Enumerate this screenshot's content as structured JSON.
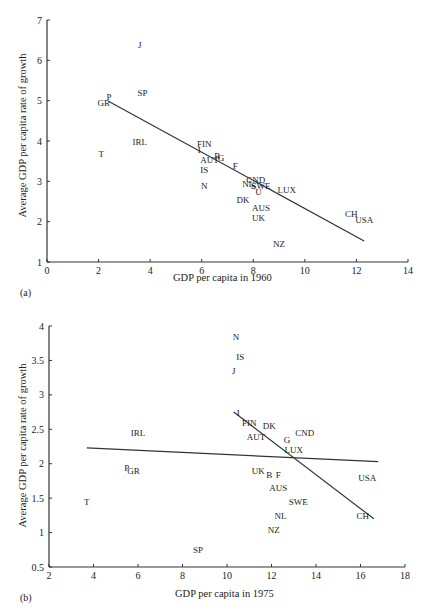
{
  "chart_data": [
    {
      "id": "a",
      "type": "scatter",
      "panel_label": "(a)",
      "title": "",
      "xlabel": "GDP per capita in 1960",
      "ylabel": "Average GDP per capita rate of growth",
      "xlim": [
        0,
        14
      ],
      "ylim": [
        1,
        7
      ],
      "xticks": [
        0,
        2,
        4,
        6,
        8,
        10,
        12,
        14
      ],
      "yticks": [
        1,
        2,
        3,
        4,
        5,
        6,
        7
      ],
      "grid": false,
      "legend": null,
      "points": [
        {
          "label": "J",
          "x": 3.6,
          "y": 6.4
        },
        {
          "label": "SP",
          "x": 3.7,
          "y": 5.2
        },
        {
          "label": "P",
          "x": 2.4,
          "y": 5.1
        },
        {
          "label": "GR",
          "x": 2.2,
          "y": 4.95
        },
        {
          "label": "IRL",
          "x": 3.6,
          "y": 4.0
        },
        {
          "label": "T",
          "x": 2.1,
          "y": 3.7
        },
        {
          "label": "FIN",
          "x": 6.1,
          "y": 3.95
        },
        {
          "label": "I",
          "x": 5.9,
          "y": 3.8
        },
        {
          "label": "AUT",
          "x": 6.3,
          "y": 3.55
        },
        {
          "label": "B",
          "x": 6.6,
          "y": 3.65
        },
        {
          "label": "G",
          "x": 6.75,
          "y": 3.6
        },
        {
          "label": "IS",
          "x": 6.1,
          "y": 3.3
        },
        {
          "label": "F",
          "x": 7.3,
          "y": 3.4
        },
        {
          "label": "N",
          "x": 6.1,
          "y": 2.9
        },
        {
          "label": "NL",
          "x": 7.8,
          "y": 2.95
        },
        {
          "label": "CND",
          "x": 8.1,
          "y": 3.05
        },
        {
          "label": "S",
          "x": 8.0,
          "y": 2.9
        },
        {
          "label": "SWE",
          "x": 8.3,
          "y": 2.9
        },
        {
          "label": "U",
          "x": 8.2,
          "y": 2.75
        },
        {
          "label": "LUX",
          "x": 9.3,
          "y": 2.8
        },
        {
          "label": "DK",
          "x": 7.6,
          "y": 2.55
        },
        {
          "label": "AUS",
          "x": 8.3,
          "y": 2.35
        },
        {
          "label": "UK",
          "x": 8.2,
          "y": 2.1
        },
        {
          "label": "CH",
          "x": 11.8,
          "y": 2.2
        },
        {
          "label": "USA",
          "x": 12.3,
          "y": 2.05
        },
        {
          "label": "NZ",
          "x": 9.0,
          "y": 1.45
        }
      ],
      "regression_lines": [
        {
          "x1": 2.4,
          "y1": 4.98,
          "x2": 12.3,
          "y2": 1.52
        }
      ]
    },
    {
      "id": "b",
      "type": "scatter",
      "panel_label": "(b)",
      "title": "",
      "xlabel": "GDP per capita in 1975",
      "ylabel": "Average GDP per capita rate of growth",
      "xlim": [
        2,
        18
      ],
      "ylim": [
        0.5,
        4
      ],
      "xticks": [
        2,
        4,
        6,
        8,
        10,
        12,
        14,
        16,
        18
      ],
      "yticks": [
        0.5,
        1,
        1.5,
        2,
        2.5,
        3,
        3.5,
        4
      ],
      "ytick_labels": [
        "0.5",
        "1",
        "1.5",
        "2",
        "2.5",
        "3",
        "3.5",
        "4"
      ],
      "grid": false,
      "legend": null,
      "points": [
        {
          "label": "N",
          "x": 10.4,
          "y": 3.85
        },
        {
          "label": "IS",
          "x": 10.6,
          "y": 3.55
        },
        {
          "label": "J",
          "x": 10.3,
          "y": 3.35
        },
        {
          "label": "IRL",
          "x": 6.0,
          "y": 2.45
        },
        {
          "label": "I",
          "x": 10.5,
          "y": 2.75
        },
        {
          "label": "FIN",
          "x": 11.0,
          "y": 2.6
        },
        {
          "label": "DK",
          "x": 11.9,
          "y": 2.55
        },
        {
          "label": "AUT",
          "x": 11.3,
          "y": 2.4
        },
        {
          "label": "G",
          "x": 12.7,
          "y": 2.35
        },
        {
          "label": "CND",
          "x": 13.5,
          "y": 2.45
        },
        {
          "label": "LUX",
          "x": 13.0,
          "y": 2.2
        },
        {
          "label": "P",
          "x": 5.5,
          "y": 1.95
        },
        {
          "label": "GR",
          "x": 5.8,
          "y": 1.9
        },
        {
          "label": "UK",
          "x": 11.4,
          "y": 1.9
        },
        {
          "label": "B",
          "x": 11.9,
          "y": 1.85
        },
        {
          "label": "F",
          "x": 12.3,
          "y": 1.85
        },
        {
          "label": "AUS",
          "x": 12.3,
          "y": 1.65
        },
        {
          "label": "USA",
          "x": 16.3,
          "y": 1.8
        },
        {
          "label": "T",
          "x": 3.7,
          "y": 1.45
        },
        {
          "label": "SWE",
          "x": 13.2,
          "y": 1.45
        },
        {
          "label": "CH",
          "x": 16.1,
          "y": 1.25
        },
        {
          "label": "NL",
          "x": 12.4,
          "y": 1.25
        },
        {
          "label": "NZ",
          "x": 12.1,
          "y": 1.05
        },
        {
          "label": "SP",
          "x": 8.7,
          "y": 0.75
        }
      ],
      "regression_lines": [
        {
          "x1": 3.7,
          "y1": 2.23,
          "x2": 16.8,
          "y2": 2.03
        },
        {
          "x1": 10.3,
          "y1": 2.75,
          "x2": 16.6,
          "y2": 1.2
        }
      ]
    }
  ]
}
